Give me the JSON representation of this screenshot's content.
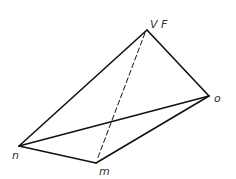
{
  "diagram": {
    "type": "tetrahedron",
    "vertices": {
      "VF": {
        "label": "V F",
        "x": 147,
        "y": 30
      },
      "o": {
        "label": "o",
        "x": 209,
        "y": 96
      },
      "n": {
        "label": "n",
        "x": 19,
        "y": 146
      },
      "m": {
        "label": "m",
        "x": 96,
        "y": 163
      }
    },
    "edges": [
      {
        "from": "n",
        "to": "VF",
        "style": "solid"
      },
      {
        "from": "VF",
        "to": "o",
        "style": "solid"
      },
      {
        "from": "n",
        "to": "o",
        "style": "solid"
      },
      {
        "from": "n",
        "to": "m",
        "style": "solid"
      },
      {
        "from": "m",
        "to": "o",
        "style": "solid"
      },
      {
        "from": "VF",
        "to": "m",
        "style": "dashed"
      }
    ],
    "labels": {
      "top": "V F",
      "right": "o",
      "left": "n",
      "bottom": "m"
    }
  }
}
